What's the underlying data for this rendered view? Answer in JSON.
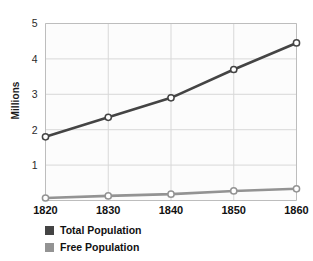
{
  "chart_data": {
    "type": "line",
    "title": "",
    "xlabel": "",
    "ylabel": "Millions",
    "x": [
      1820,
      1830,
      1840,
      1850,
      1860
    ],
    "categories": [
      "1820",
      "1830",
      "1840",
      "1850",
      "1860"
    ],
    "xlim": [
      1820,
      1860
    ],
    "ylim": [
      0,
      5
    ],
    "yticks": [
      1,
      2,
      3,
      4,
      5
    ],
    "ytick_labels": [
      "1",
      "2",
      "3",
      "4",
      "5"
    ],
    "xticks": [
      1820,
      1830,
      1840,
      1850,
      1860
    ],
    "xtick_labels": [
      "1820",
      "1830",
      "1840",
      "1850",
      "1860"
    ],
    "grid": true,
    "legend_position": "below-left",
    "series": [
      {
        "name": "Total Population",
        "color": "#444444",
        "marker": "open-circle",
        "values": [
          1.8,
          2.35,
          2.9,
          3.7,
          4.45
        ]
      },
      {
        "name": "Free Population",
        "color": "#939393",
        "marker": "open-circle",
        "values": [
          0.07,
          0.13,
          0.18,
          0.27,
          0.33
        ]
      }
    ]
  },
  "axes": {
    "ylabel": "Millions",
    "ytick_labels": [
      "1",
      "2",
      "3",
      "4",
      "5"
    ],
    "xtick_labels": [
      "1820",
      "1830",
      "1840",
      "1850",
      "1860"
    ]
  },
  "legend": {
    "items": [
      {
        "label": "Total Population",
        "color": "#444444"
      },
      {
        "label": "Free Population",
        "color": "#939393"
      }
    ]
  },
  "colors": {
    "total_population": "#444444",
    "free_population": "#939393",
    "grid": "#d8d8d8",
    "axis": "#bdbdbd",
    "plot_background": "#fcfcfc",
    "page_background": "#ffffff",
    "text": "#111111"
  }
}
